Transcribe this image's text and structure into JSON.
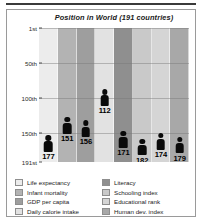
{
  "chart_data": {
    "type": "bar",
    "title": "Position in World (191 countries)",
    "xlabel": "",
    "ylabel": "",
    "ylim": [
      1,
      191
    ],
    "y_inverted": true,
    "grid": true,
    "legend_position": "bottom",
    "ytick_labels": [
      "1st",
      "50th",
      "100th",
      "150th",
      "191st"
    ],
    "ytick_values": [
      1,
      50,
      100,
      150,
      191
    ],
    "categories": [
      "Life expectancy",
      "Infant mortality",
      "GDP per capita",
      "Daily calorie intake",
      "Literacy",
      "Schooling index",
      "Educational rank",
      "Human dev. index"
    ],
    "values": [
      177,
      151,
      156,
      112,
      171,
      182,
      174,
      179
    ],
    "band_colors": [
      "#ececec",
      "#b3b3b3",
      "#9e9e9e",
      "#e2e2e2",
      "#8f8f8f",
      "#c9c9c9",
      "#d5d5d5",
      "#a8a8a8"
    ],
    "marker": "person-pictogram",
    "marker_color": "#0a0a0a"
  },
  "legend": {
    "left": [
      {
        "label": "Life expectancy",
        "color": "#ececec"
      },
      {
        "label": "Infant mortality",
        "color": "#b3b3b3"
      },
      {
        "label": "GDP per capita",
        "color": "#9e9e9e"
      },
      {
        "label": "Daily calorie intake",
        "color": "#e2e2e2"
      }
    ],
    "right": [
      {
        "label": "Literacy",
        "color": "#8f8f8f"
      },
      {
        "label": "Schooling index",
        "color": "#c9c9c9"
      },
      {
        "label": "Educational rank",
        "color": "#d5d5d5"
      },
      {
        "label": "Human dev. index",
        "color": "#a8a8a8"
      }
    ]
  }
}
